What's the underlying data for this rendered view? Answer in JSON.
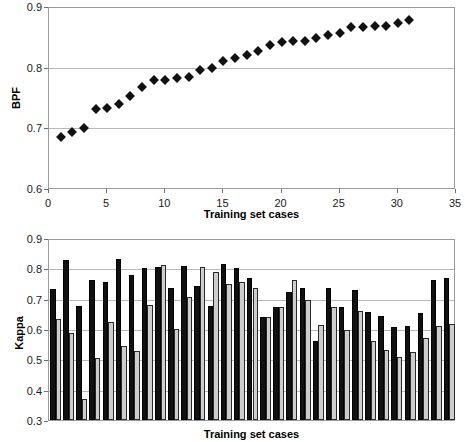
{
  "chart_data": [
    {
      "id": "bpf-scatter",
      "type": "scatter",
      "title": "",
      "xlabel": "Training set cases",
      "ylabel": "BPF",
      "xlim": [
        0,
        35
      ],
      "ylim": [
        0.6,
        0.9
      ],
      "xticks": [
        "0",
        "5",
        "10",
        "15",
        "20",
        "25",
        "30",
        "35"
      ],
      "xtick_values": [
        0,
        5,
        10,
        15,
        20,
        25,
        30,
        35
      ],
      "yticks": [
        "0.6",
        "0.7",
        "0.8",
        "0.9"
      ],
      "ytick_values": [
        0.6,
        0.7,
        0.8,
        0.9
      ],
      "grid": true,
      "legend": "none",
      "marker": "diamond",
      "marker_color": "#111111",
      "x": [
        1,
        2,
        3,
        4,
        5,
        6,
        7,
        8,
        9,
        10,
        11,
        12,
        13,
        14,
        15,
        16,
        17,
        18,
        19,
        20,
        21,
        22,
        23,
        24,
        25,
        26,
        27,
        28,
        29,
        30,
        31
      ],
      "y": [
        0.688,
        0.695,
        0.703,
        0.734,
        0.735,
        0.741,
        0.755,
        0.769,
        0.781,
        0.781,
        0.785,
        0.786,
        0.797,
        0.801,
        0.813,
        0.818,
        0.822,
        0.829,
        0.839,
        0.844,
        0.845,
        0.846,
        0.851,
        0.855,
        0.859,
        0.868,
        0.869,
        0.87,
        0.87,
        0.875,
        0.881
      ]
    },
    {
      "id": "kappa-bars",
      "type": "bar",
      "title": "",
      "xlabel": "Training set cases",
      "ylabel": "Kappa",
      "ylim": [
        0.3,
        0.9
      ],
      "yticks": [
        "0.3",
        "0.4",
        "0.5",
        "0.6",
        "0.7",
        "0.8",
        "0.9"
      ],
      "ytick_values": [
        0.3,
        0.4,
        0.5,
        0.6,
        0.7,
        0.8,
        0.9
      ],
      "xticks": [],
      "grid": true,
      "legend": "none",
      "categories": [
        "1",
        "2",
        "3",
        "4",
        "5",
        "6",
        "7",
        "8",
        "9",
        "10",
        "11",
        "12",
        "13",
        "14",
        "15",
        "16",
        "17",
        "18",
        "19",
        "20",
        "21",
        "22",
        "23",
        "24",
        "25",
        "26",
        "27",
        "28",
        "29",
        "30",
        "31"
      ],
      "series": [
        {
          "name": "series-dark",
          "color": "#111111",
          "values": [
            0.731,
            0.828,
            0.677,
            0.76,
            0.755,
            0.831,
            0.779,
            0.8,
            0.804,
            0.735,
            0.809,
            0.741,
            0.677,
            0.815,
            0.802,
            0.767,
            0.641,
            0.674,
            0.722,
            0.735,
            0.56,
            0.734,
            0.672,
            0.727,
            0.657,
            0.644,
            0.608,
            0.611,
            0.654,
            0.76,
            0.769
          ]
        },
        {
          "name": "series-light",
          "color": "#cdcdcd",
          "values": [
            0.633,
            0.586,
            0.369,
            0.503,
            0.624,
            0.543,
            0.527,
            0.679,
            0.811,
            0.599,
            0.707,
            0.805,
            0.789,
            0.749,
            0.754,
            0.735,
            0.638,
            0.671,
            0.761,
            0.697,
            0.614,
            0.671,
            0.597,
            0.661,
            0.561,
            0.531,
            0.508,
            0.525,
            0.569,
            0.609,
            0.618
          ]
        }
      ]
    }
  ]
}
